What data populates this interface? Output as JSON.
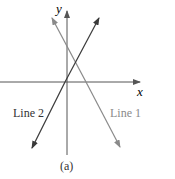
{
  "figure": {
    "caption": "(a)",
    "axes": {
      "x_label": "x",
      "y_label": "y",
      "axis_color": "#555555"
    },
    "lines": [
      {
        "label": "Line 1",
        "color": "#8a8a8a",
        "direction": "negative slope"
      },
      {
        "label": "Line 2",
        "color": "#3a3a3a",
        "direction": "positive slope"
      }
    ]
  }
}
